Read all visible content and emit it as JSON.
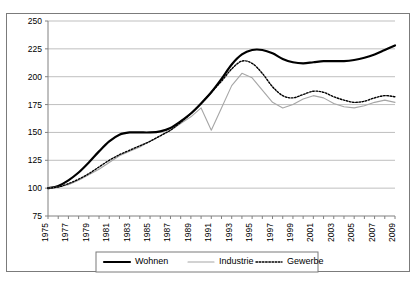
{
  "chart_data": {
    "type": "line",
    "title": "",
    "subtitle": "",
    "xlabel": "",
    "ylabel": "",
    "xlim": [
      1975,
      2009
    ],
    "ylim": [
      75,
      250
    ],
    "yticks": [
      75,
      100,
      125,
      150,
      175,
      200,
      225,
      250
    ],
    "grid": "horizontal",
    "legend_position": "bottom",
    "x": [
      1975,
      1976,
      1977,
      1978,
      1979,
      1980,
      1981,
      1982,
      1983,
      1984,
      1985,
      1986,
      1987,
      1988,
      1989,
      1990,
      1991,
      1992,
      1993,
      1994,
      1995,
      1996,
      1997,
      1998,
      1999,
      2000,
      2001,
      2002,
      2003,
      2004,
      2005,
      2006,
      2007,
      2008,
      2009
    ],
    "xtick_labels": [
      "1975",
      "1977",
      "1979",
      "1981",
      "1983",
      "1985",
      "1987",
      "1989",
      "1991",
      "1993",
      "1995",
      "1997",
      "1999",
      "2001",
      "2003",
      "2005",
      "2007",
      "2009"
    ],
    "series": [
      {
        "name": "Wohnen",
        "color": "#000000",
        "style": "solid",
        "width": 2.2,
        "values": [
          100,
          102,
          107,
          114,
          123,
          133,
          142,
          148,
          150,
          150,
          150,
          151,
          154,
          160,
          167,
          176,
          186,
          198,
          211,
          220,
          224,
          224,
          221,
          216,
          213,
          212,
          213,
          214,
          214,
          214,
          215,
          217,
          220,
          224,
          228
        ]
      },
      {
        "name": "Industrie",
        "color": "#a6a6a6",
        "style": "solid",
        "width": 1.1,
        "values": [
          100,
          101,
          103,
          107,
          112,
          117,
          123,
          129,
          133,
          137,
          142,
          147,
          152,
          158,
          164,
          172,
          152,
          172,
          192,
          203,
          199,
          188,
          177,
          172,
          175,
          180,
          183,
          181,
          176,
          173,
          172,
          174,
          177,
          179,
          177
        ]
      },
      {
        "name": "Gewerbe",
        "color": "#000000",
        "style": "dotted",
        "width": 1.4,
        "values": [
          100,
          101,
          104,
          108,
          113,
          119,
          125,
          130,
          134,
          138,
          142,
          147,
          152,
          159,
          167,
          176,
          186,
          196,
          207,
          214,
          212,
          203,
          191,
          183,
          181,
          184,
          187,
          186,
          182,
          179,
          177,
          178,
          181,
          183,
          182
        ]
      }
    ]
  },
  "legend": {
    "items": [
      {
        "label": "Wohnen",
        "swatch": "solid-thick-black"
      },
      {
        "label": "Industrie",
        "swatch": "solid-thin-gray"
      },
      {
        "label": "Gewerbe",
        "swatch": "dotted-black"
      }
    ]
  },
  "colors": {
    "wohnen": "#000000",
    "industrie": "#a6a6a6",
    "gewerbe": "#000000",
    "grid": "#bfbfbf",
    "axis": "#808080",
    "frame": "#7b7b7b",
    "background": "#ffffff"
  }
}
